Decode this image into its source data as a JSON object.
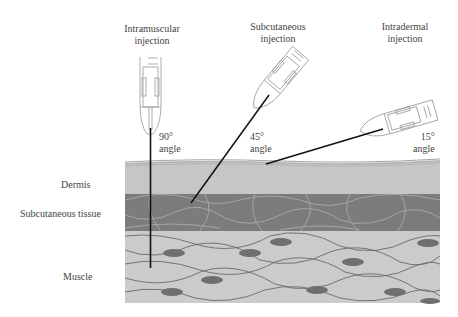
{
  "injections": [
    {
      "title_line1": "Intramuscular",
      "title_line2": "injection",
      "angle_value": "90°",
      "angle_word": "angle"
    },
    {
      "title_line1": "Subcutaneous",
      "title_line2": "injection",
      "angle_value": "45°",
      "angle_word": "angle"
    },
    {
      "title_line1": "Intradermal",
      "title_line2": "injection",
      "angle_value": "15°",
      "angle_word": "angle"
    }
  ],
  "layers": {
    "dermis": "Dermis",
    "subcutaneous": "Subcutaneous tissue",
    "muscle": "Muscle"
  },
  "colors": {
    "dermis": "#c6c6c6",
    "subcutaneous": "#7c7c7c",
    "muscle": "#cbcbcb",
    "nucleus": "#6f6f6f",
    "needle": "#111111"
  }
}
